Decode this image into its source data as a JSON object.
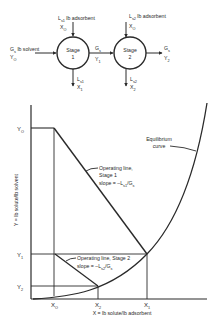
{
  "flow_diagram": {
    "stage1": {
      "label_line1": "Stage",
      "label_line2": "1"
    },
    "stage2": {
      "label_line1": "Stage",
      "label_line2": "2"
    },
    "feed_in": {
      "label": "G",
      "sub": "s",
      "unit": " lb solvent",
      "y_label": "Y",
      "y_sub": "O"
    },
    "adsorbent1_in": {
      "label": "L",
      "sub": "s1",
      "unit": " lb adsorbent",
      "x_label": "X",
      "x_sub": "O"
    },
    "adsorbent2_in": {
      "label": "L",
      "sub": "s2",
      "unit": " lb adsorbent",
      "x_label": "X",
      "x_sub": "O"
    },
    "stage1_to_stage2": {
      "label": "G",
      "sub": "s",
      "y_label": "Y",
      "y_sub": "1"
    },
    "product_out": {
      "label": "G",
      "sub": "s",
      "y_label": "Y",
      "y_sub": "2"
    },
    "adsorbent1_out": {
      "label": "L",
      "sub": "s1",
      "x_label": "X",
      "x_sub": "1"
    },
    "adsorbent2_out": {
      "label": "L",
      "sub": "s2",
      "x_label": "X",
      "x_sub": "2"
    }
  },
  "graph": {
    "y_axis_label": "Y = lb solute/lb solvent",
    "x_axis_label": "X = lb solute/lb adsorbent",
    "y_ticks": [
      {
        "label": "Y",
        "sub": "O"
      },
      {
        "label": "Y",
        "sub": "1"
      },
      {
        "label": "Y",
        "sub": "2"
      }
    ],
    "x_ticks": [
      {
        "label": "X",
        "sub": "O"
      },
      {
        "label": "X",
        "sub": "2"
      },
      {
        "label": "X",
        "sub": "1"
      }
    ],
    "equilibrium_label_line1": "Equilibrium",
    "equilibrium_label_line2": "curve",
    "op_line1": {
      "line1": "Operating line,",
      "line2": "Stage 1",
      "slope_prefix": "slope = –L",
      "slope_sub": "s1",
      "slope_suffix": "/G",
      "slope_sub2": "s"
    },
    "op_line2": {
      "line1": "Operating line, Stage 2",
      "slope_prefix": "slope = –L",
      "slope_sub": "s2",
      "slope_suffix": "/G",
      "slope_sub2": "s"
    }
  },
  "colors": {
    "line": "#2a2a2a",
    "background": "#ffffff"
  }
}
